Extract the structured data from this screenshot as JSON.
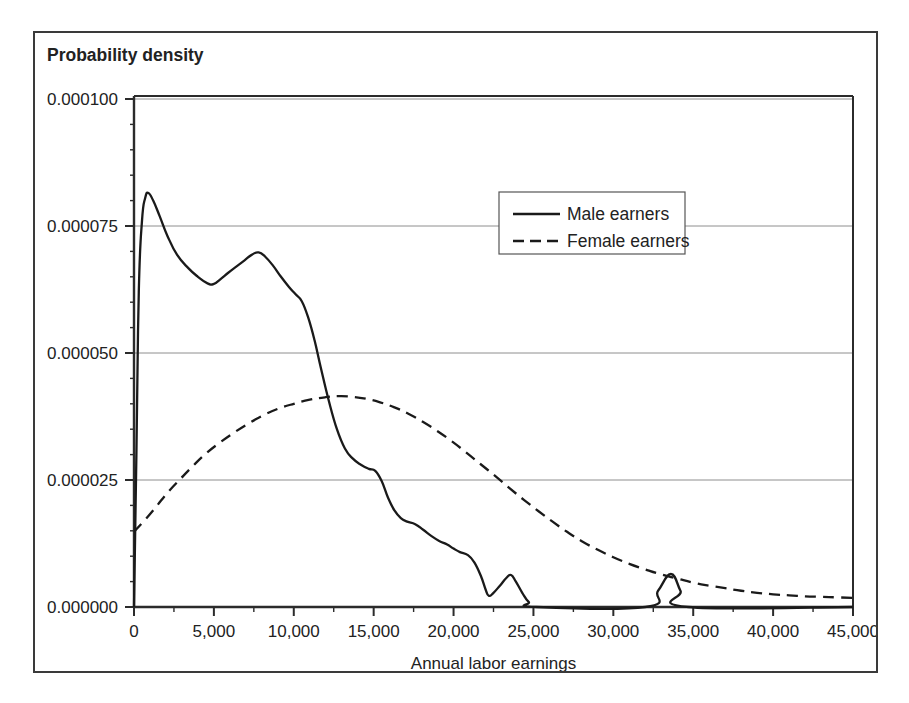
{
  "figure": {
    "title": "Probability density",
    "border_color": "#3a3a3a",
    "background": "#ffffff"
  },
  "axes": {
    "x_title": "Annual labor earnings",
    "y_title": "Probability density",
    "x_ticks": [
      "0",
      "5,000",
      "10,000",
      "15,000",
      "20,000",
      "25,000",
      "30,000",
      "35,000",
      "40,000",
      "45,000"
    ],
    "y_ticks": [
      "0.000000",
      "0.000025",
      "0.000050",
      "0.000075",
      "0.000100"
    ]
  },
  "legend": {
    "items": [
      {
        "label": "Male earners",
        "style": "solid",
        "color": "#1a1a1a"
      },
      {
        "label": "Female earners",
        "style": "dashed",
        "color": "#1a1a1a"
      }
    ]
  },
  "chart_data": {
    "type": "line",
    "title": "Probability density",
    "xlabel": "Annual labor earnings",
    "ylabel": "Probability density",
    "xlim": [
      0,
      45000
    ],
    "ylim": [
      0,
      0.0001
    ],
    "xticks": [
      0,
      5000,
      10000,
      15000,
      20000,
      25000,
      30000,
      35000,
      40000,
      45000
    ],
    "yticks": [
      0.0,
      2.5e-05,
      5e-05,
      7.5e-05,
      0.0001
    ],
    "x_minor_tick_interval": 2500,
    "y_minor_tick_interval": 5e-06,
    "grid": "horizontal-major-only",
    "legend_position": "upper-center-right",
    "series": [
      {
        "name": "Male earners",
        "style": "solid",
        "color": "#1a1a1a",
        "points": [
          [
            0,
            0.0
          ],
          [
            150,
            3e-05
          ],
          [
            300,
            6.2e-05
          ],
          [
            500,
            7.6e-05
          ],
          [
            700,
            8.05e-05
          ],
          [
            900,
            8.15e-05
          ],
          [
            1200,
            8e-05
          ],
          [
            1600,
            7.7e-05
          ],
          [
            2100,
            7.3e-05
          ],
          [
            2700,
            6.93e-05
          ],
          [
            3400,
            6.67e-05
          ],
          [
            4000,
            6.5e-05
          ],
          [
            4600,
            6.37e-05
          ],
          [
            5000,
            6.36e-05
          ],
          [
            5400,
            6.45e-05
          ],
          [
            5900,
            6.58e-05
          ],
          [
            6400,
            6.7e-05
          ],
          [
            6900,
            6.82e-05
          ],
          [
            7400,
            6.94e-05
          ],
          [
            7800,
            6.98e-05
          ],
          [
            8200,
            6.9e-05
          ],
          [
            8700,
            6.72e-05
          ],
          [
            9200,
            6.5e-05
          ],
          [
            9700,
            6.3e-05
          ],
          [
            10100,
            6.16e-05
          ],
          [
            10500,
            6.02e-05
          ],
          [
            10900,
            5.7e-05
          ],
          [
            11300,
            5.25e-05
          ],
          [
            11700,
            4.7e-05
          ],
          [
            12200,
            4.05e-05
          ],
          [
            12700,
            3.5e-05
          ],
          [
            13200,
            3.12e-05
          ],
          [
            13700,
            2.92e-05
          ],
          [
            14200,
            2.8e-05
          ],
          [
            14700,
            2.72e-05
          ],
          [
            15100,
            2.68e-05
          ],
          [
            15500,
            2.48e-05
          ],
          [
            15900,
            2.15e-05
          ],
          [
            16300,
            1.9e-05
          ],
          [
            16700,
            1.75e-05
          ],
          [
            17100,
            1.68e-05
          ],
          [
            17600,
            1.63e-05
          ],
          [
            18100,
            1.52e-05
          ],
          [
            18600,
            1.4e-05
          ],
          [
            19100,
            1.3e-05
          ],
          [
            19600,
            1.23e-05
          ],
          [
            20000,
            1.15e-05
          ],
          [
            20400,
            1.08e-05
          ],
          [
            20900,
            1.02e-05
          ],
          [
            21300,
            8.8e-06
          ],
          [
            21700,
            6.2e-06
          ],
          [
            22000,
            3.5e-06
          ],
          [
            22200,
            2.2e-06
          ],
          [
            22500,
            2.8e-06
          ],
          [
            22900,
            4.2e-06
          ],
          [
            23300,
            5.7e-06
          ],
          [
            23600,
            6.3e-06
          ],
          [
            23900,
            5e-06
          ],
          [
            24300,
            2.8e-06
          ],
          [
            24700,
            1e-06
          ],
          [
            25200,
            0.0
          ],
          [
            32000,
            0.0
          ],
          [
            32800,
            3.2e-06
          ],
          [
            33600,
            6.5e-06
          ],
          [
            34200,
            3.2e-06
          ],
          [
            34700,
            0.0
          ],
          [
            45000,
            0.0
          ]
        ]
      },
      {
        "name": "Female earners",
        "style": "dashed",
        "color": "#1a1a1a",
        "points": [
          [
            0,
            1.48e-05
          ],
          [
            700,
            1.72e-05
          ],
          [
            1400,
            1.98e-05
          ],
          [
            2100,
            2.25e-05
          ],
          [
            2900,
            2.52e-05
          ],
          [
            3700,
            2.78e-05
          ],
          [
            4500,
            3.02e-05
          ],
          [
            5300,
            3.22e-05
          ],
          [
            6200,
            3.42e-05
          ],
          [
            7100,
            3.6e-05
          ],
          [
            8000,
            3.76e-05
          ],
          [
            9000,
            3.9e-05
          ],
          [
            10000,
            4e-05
          ],
          [
            11000,
            4.08e-05
          ],
          [
            12000,
            4.13e-05
          ],
          [
            12800,
            4.15e-05
          ],
          [
            13600,
            4.14e-05
          ],
          [
            14500,
            4.1e-05
          ],
          [
            15400,
            4.03e-05
          ],
          [
            16300,
            3.93e-05
          ],
          [
            17200,
            3.8e-05
          ],
          [
            18100,
            3.64e-05
          ],
          [
            19000,
            3.46e-05
          ],
          [
            19900,
            3.26e-05
          ],
          [
            20800,
            3.04e-05
          ],
          [
            21700,
            2.81e-05
          ],
          [
            22600,
            2.58e-05
          ],
          [
            23500,
            2.34e-05
          ],
          [
            24400,
            2.11e-05
          ],
          [
            25300,
            1.89e-05
          ],
          [
            26200,
            1.68e-05
          ],
          [
            27100,
            1.48e-05
          ],
          [
            28000,
            1.3e-05
          ],
          [
            29000,
            1.13e-05
          ],
          [
            30000,
            9.8e-06
          ],
          [
            31000,
            8.5e-06
          ],
          [
            32000,
            7.4e-06
          ],
          [
            33000,
            6.4e-06
          ],
          [
            34000,
            5.6e-06
          ],
          [
            35000,
            4.8e-06
          ],
          [
            36000,
            4.2e-06
          ],
          [
            37000,
            3.7e-06
          ],
          [
            38000,
            3.2e-06
          ],
          [
            39000,
            2.8e-06
          ],
          [
            40000,
            2.5e-06
          ],
          [
            41000,
            2.3e-06
          ],
          [
            42000,
            2.1e-06
          ],
          [
            43000,
            2e-06
          ],
          [
            44000,
            1.9e-06
          ],
          [
            45000,
            1.8e-06
          ]
        ]
      }
    ]
  }
}
